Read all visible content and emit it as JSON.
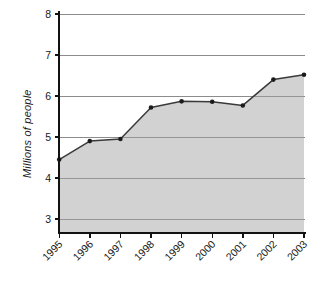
{
  "chart_data": {
    "type": "area",
    "title": "",
    "subtitle": "",
    "xlabel": "",
    "ylabel": "Millions of people",
    "categories": [
      "1995",
      "1996",
      "1997",
      "1998",
      "1999",
      "2000",
      "2001",
      "2002",
      "2003"
    ],
    "values": [
      4.45,
      4.9,
      4.95,
      5.72,
      5.87,
      5.86,
      5.77,
      6.4,
      6.52
    ],
    "series": [
      {
        "name": "Millions of people",
        "values": [
          4.45,
          4.9,
          4.95,
          5.72,
          5.87,
          5.86,
          5.77,
          6.4,
          6.52
        ]
      }
    ],
    "ylim": [
      3,
      8
    ],
    "yticks": [
      3,
      4,
      5,
      6,
      7,
      8
    ],
    "ytick_labels": [
      "3",
      "4",
      "5",
      "6",
      "7",
      "8"
    ],
    "xtick_labels": [
      "1995",
      "1996",
      "1997",
      "1998",
      "1999",
      "2000",
      "2001",
      "2002",
      "2003"
    ],
    "xtick_rotation": 45,
    "grid": true,
    "grid_axis": "y",
    "legend": false,
    "legend_position": "none",
    "colors": {
      "area_fill": "#d2d2d2",
      "line": "#3a3a3a",
      "marker": "#1c1c1c",
      "gridline": "#8c8c8c",
      "axis": "#121212",
      "text": "#1a1a1a",
      "background": "#ffffff"
    },
    "annotations": []
  }
}
